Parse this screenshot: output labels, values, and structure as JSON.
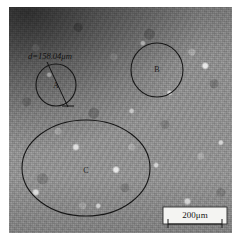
{
  "figure": {
    "type": "optical-micrograph",
    "background_color": "#909090",
    "annotation_color": "#171717"
  },
  "plate": {
    "x": 9,
    "y": 7,
    "width": 223,
    "height": 226
  },
  "regions": [
    {
      "id": "A",
      "label": "A",
      "shape": "circle",
      "cx": 56,
      "cy": 85,
      "rx": 20,
      "ry": 21,
      "label_x": 56,
      "label_y": 86
    },
    {
      "id": "B",
      "label": "B",
      "shape": "circle",
      "cx": 157,
      "cy": 70,
      "rx": 26,
      "ry": 27,
      "label_x": 157,
      "label_y": 70
    },
    {
      "id": "C",
      "label": "C",
      "shape": "ellipse",
      "cx": 86,
      "cy": 168,
      "rx": 64,
      "ry": 48,
      "label_x": 86,
      "label_y": 171
    }
  ],
  "measurement": {
    "text": "d=158.04μm",
    "symbol": "d",
    "equals": "=",
    "value": "158.04",
    "unit": "μm",
    "text_x": 28,
    "text_y": 59,
    "leader": {
      "x1": 47,
      "y1": 62,
      "x2": 68,
      "y2": 107
    },
    "end_tick": {
      "x1": 62,
      "y1": 106,
      "x2": 74,
      "y2": 106
    }
  },
  "scale_bar": {
    "label": "200μm",
    "value": "200",
    "unit": "μm",
    "box": {
      "x": 163,
      "y": 207,
      "width": 64,
      "height": 17
    },
    "text_x": 195,
    "text_y": 216,
    "bar": {
      "x1": 168,
      "y1": 224,
      "x2": 222,
      "y2": 224
    },
    "tick_left": {
      "x": 168,
      "y1": 219,
      "y2": 228
    },
    "tick_right": {
      "x": 222,
      "y1": 219,
      "y2": 228
    }
  }
}
